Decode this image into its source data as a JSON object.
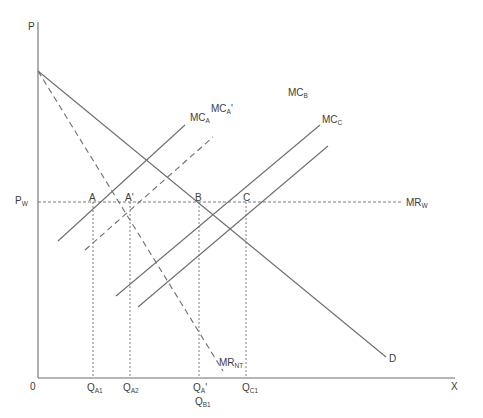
{
  "diagram": {
    "type": "economics-supply-demand",
    "axes": {
      "y_label": "P",
      "x_label": "X",
      "origin_label": "0"
    },
    "price_line": {
      "left_label": "P",
      "left_label_sub": "W",
      "right_label": "MR",
      "right_label_sub": "W",
      "style": "dashed"
    },
    "curves": [
      {
        "id": "D",
        "label": "D",
        "sub": "",
        "style": "solid"
      },
      {
        "id": "MR_NT",
        "label": "MR",
        "sub": "NT",
        "style": "dashed"
      },
      {
        "id": "MC_A",
        "label": "MC",
        "sub": "A",
        "style": "solid"
      },
      {
        "id": "MC_A_prime",
        "label": "MC",
        "sub": "A",
        "prime": "'",
        "style": "dashed"
      },
      {
        "id": "MC_B",
        "label": "MC",
        "sub": "B",
        "style": "solid"
      },
      {
        "id": "MC_C",
        "label": "MC",
        "sub": "C",
        "style": "solid"
      }
    ],
    "points": [
      {
        "label": "A"
      },
      {
        "label": "A'"
      },
      {
        "label": "B"
      },
      {
        "label": "C"
      }
    ],
    "quantity_ticks": [
      {
        "label": "Q",
        "sub": "A1"
      },
      {
        "label": "Q",
        "sub": "A2"
      },
      {
        "label": "Q",
        "sub": "A",
        "prime": "'",
        "second_label": "Q",
        "second_sub": "B1"
      },
      {
        "label": "Q",
        "sub": "C1"
      }
    ],
    "colors": {
      "line": "#6e6e6e",
      "text": "#3c3c3c",
      "background": "#ffffff"
    }
  }
}
